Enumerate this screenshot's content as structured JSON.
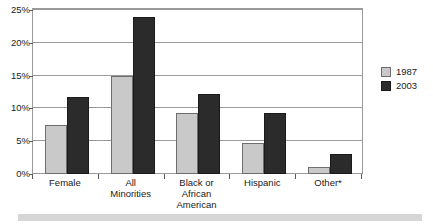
{
  "chart_data": {
    "type": "bar",
    "title": "",
    "subtitle": "",
    "xlabel": "",
    "ylabel": "",
    "ylim": [
      0,
      25
    ],
    "ytick_values": [
      0,
      5,
      10,
      15,
      20,
      25
    ],
    "ytick_labels": [
      "0%",
      "5%",
      "10%",
      "15%",
      "20%",
      "25%"
    ],
    "grid": true,
    "legend_position": "right",
    "categories": [
      "Female",
      "All Minorities",
      "Black or African American",
      "Hispanic",
      "Other*"
    ],
    "category_label_lines": [
      [
        "Female"
      ],
      [
        "All",
        "Minorities"
      ],
      [
        "Black or",
        "African",
        "American"
      ],
      [
        "Hispanic"
      ],
      [
        "Other*"
      ]
    ],
    "series": [
      {
        "name": "1987",
        "color": "#c9c9c9",
        "values": [
          7.5,
          15.0,
          9.3,
          4.8,
          1.1
        ]
      },
      {
        "name": "2003",
        "color": "#2b2b2b",
        "values": [
          11.7,
          23.9,
          12.2,
          9.3,
          3.0
        ]
      }
    ],
    "annotations": []
  },
  "legend": {
    "items": [
      {
        "label": "1987"
      },
      {
        "label": "2003"
      }
    ]
  },
  "colors": {
    "series_1987": "#c9c9c9",
    "series_2003": "#2b2b2b",
    "axis": "#9a9a9a",
    "text": "#1a1a1a",
    "bottom_strip": "#d6d6d6"
  }
}
